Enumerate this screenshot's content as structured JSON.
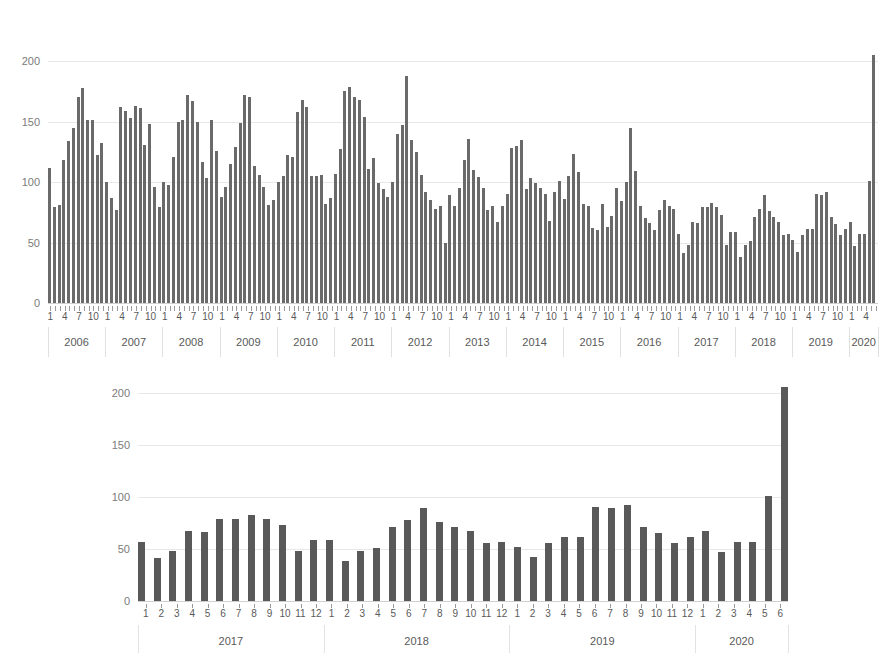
{
  "document": {
    "title_remnant": "",
    "background_color": "#ffffff",
    "bar_color": "#5f5f5f",
    "gridline_color": "#e8e8e8",
    "text_color": "#595959"
  },
  "chart_data": [
    {
      "id": "monthly-series-full",
      "type": "bar",
      "title": "",
      "subtitle": "",
      "xlabel": "",
      "ylabel": "",
      "ylim": [
        0,
        215
      ],
      "yticks": [
        0,
        50,
        100,
        150,
        200
      ],
      "ytick_labels": [
        "0",
        "50",
        "100",
        "150",
        "200"
      ],
      "grid": true,
      "legend": false,
      "x_month_tick_labels": [
        "1",
        "4",
        "7",
        "10"
      ],
      "year_groups": [
        "2006",
        "2007",
        "2008",
        "2009",
        "2010",
        "2011",
        "2012",
        "2013",
        "2014",
        "2015",
        "2016",
        "2017",
        "2018",
        "2019",
        "2020"
      ],
      "x_start": "2006-01",
      "x_end": "2020-06",
      "categories": [
        "2006-1",
        "2006-2",
        "2006-3",
        "2006-4",
        "2006-5",
        "2006-6",
        "2006-7",
        "2006-8",
        "2006-9",
        "2006-10",
        "2006-11",
        "2006-12",
        "2007-1",
        "2007-2",
        "2007-3",
        "2007-4",
        "2007-5",
        "2007-6",
        "2007-7",
        "2007-8",
        "2007-9",
        "2007-10",
        "2007-11",
        "2007-12",
        "2008-1",
        "2008-2",
        "2008-3",
        "2008-4",
        "2008-5",
        "2008-6",
        "2008-7",
        "2008-8",
        "2008-9",
        "2008-10",
        "2008-11",
        "2008-12",
        "2009-1",
        "2009-2",
        "2009-3",
        "2009-4",
        "2009-5",
        "2009-6",
        "2009-7",
        "2009-8",
        "2009-9",
        "2009-10",
        "2009-11",
        "2009-12",
        "2010-1",
        "2010-2",
        "2010-3",
        "2010-4",
        "2010-5",
        "2010-6",
        "2010-7",
        "2010-8",
        "2010-9",
        "2010-10",
        "2010-11",
        "2010-12",
        "2011-1",
        "2011-2",
        "2011-3",
        "2011-4",
        "2011-5",
        "2011-6",
        "2011-7",
        "2011-8",
        "2011-9",
        "2011-10",
        "2011-11",
        "2011-12",
        "2012-1",
        "2012-2",
        "2012-3",
        "2012-4",
        "2012-5",
        "2012-6",
        "2012-7",
        "2012-8",
        "2012-9",
        "2012-10",
        "2012-11",
        "2012-12",
        "2013-1",
        "2013-2",
        "2013-3",
        "2013-4",
        "2013-5",
        "2013-6",
        "2013-7",
        "2013-8",
        "2013-9",
        "2013-10",
        "2013-11",
        "2013-12",
        "2014-1",
        "2014-2",
        "2014-3",
        "2014-4",
        "2014-5",
        "2014-6",
        "2014-7",
        "2014-8",
        "2014-9",
        "2014-10",
        "2014-11",
        "2014-12",
        "2015-1",
        "2015-2",
        "2015-3",
        "2015-4",
        "2015-5",
        "2015-6",
        "2015-7",
        "2015-8",
        "2015-9",
        "2015-10",
        "2015-11",
        "2015-12",
        "2016-1",
        "2016-2",
        "2016-3",
        "2016-4",
        "2016-5",
        "2016-6",
        "2016-7",
        "2016-8",
        "2016-9",
        "2016-10",
        "2016-11",
        "2016-12",
        "2017-1",
        "2017-2",
        "2017-3",
        "2017-4",
        "2017-5",
        "2017-6",
        "2017-7",
        "2017-8",
        "2017-9",
        "2017-10",
        "2017-11",
        "2017-12",
        "2018-1",
        "2018-2",
        "2018-3",
        "2018-4",
        "2018-5",
        "2018-6",
        "2018-7",
        "2018-8",
        "2018-9",
        "2018-10",
        "2018-11",
        "2018-12",
        "2019-1",
        "2019-2",
        "2019-3",
        "2019-4",
        "2019-5",
        "2019-6",
        "2019-7",
        "2019-8",
        "2019-9",
        "2019-10",
        "2019-11",
        "2019-12",
        "2020-1",
        "2020-2",
        "2020-3",
        "2020-4",
        "2020-5",
        "2020-6"
      ],
      "values": [
        112,
        79,
        81,
        118,
        134,
        145,
        170,
        178,
        151,
        151,
        122,
        132,
        100,
        87,
        77,
        162,
        159,
        153,
        163,
        161,
        131,
        148,
        96,
        79,
        100,
        98,
        121,
        150,
        151,
        172,
        167,
        150,
        117,
        103,
        151,
        126,
        88,
        96,
        115,
        129,
        149,
        172,
        170,
        113,
        106,
        96,
        81,
        85,
        100,
        105,
        122,
        121,
        158,
        168,
        162,
        105,
        105,
        106,
        82,
        87,
        107,
        127,
        175,
        179,
        170,
        168,
        154,
        111,
        120,
        99,
        94,
        88,
        100,
        140,
        147,
        188,
        135,
        125,
        106,
        92,
        85,
        78,
        80,
        50,
        89,
        80,
        95,
        118,
        136,
        110,
        104,
        95,
        77,
        80,
        67,
        80,
        90,
        128,
        130,
        135,
        94,
        103,
        99,
        95,
        90,
        68,
        92,
        101,
        86,
        105,
        123,
        108,
        82,
        80,
        62,
        60,
        82,
        63,
        72,
        95,
        84,
        100,
        145,
        109,
        80,
        70,
        66,
        60,
        77,
        85,
        80,
        78,
        57,
        41,
        48,
        67,
        66,
        79,
        79,
        83,
        79,
        73,
        48,
        59,
        59,
        38,
        48,
        51,
        71,
        78,
        89,
        76,
        71,
        67,
        56,
        57,
        52,
        42,
        56,
        61,
        61,
        90,
        89,
        92,
        71,
        65,
        56,
        61,
        67,
        47,
        57,
        57,
        101,
        205
      ]
    },
    {
      "id": "monthly-series-recent",
      "type": "bar",
      "title": "",
      "subtitle": "",
      "xlabel": "",
      "ylabel": "",
      "ylim": [
        0,
        215
      ],
      "yticks": [
        0,
        50,
        100,
        150,
        200
      ],
      "ytick_labels": [
        "0",
        "50",
        "100",
        "150",
        "200"
      ],
      "grid": true,
      "legend": false,
      "year_groups": [
        "2017",
        "2018",
        "2019",
        "2020"
      ],
      "x_start": "2017-01",
      "x_end": "2020-06",
      "categories": [
        "2017-1",
        "2017-2",
        "2017-3",
        "2017-4",
        "2017-5",
        "2017-6",
        "2017-7",
        "2017-8",
        "2017-9",
        "2017-10",
        "2017-11",
        "2017-12",
        "2018-1",
        "2018-2",
        "2018-3",
        "2018-4",
        "2018-5",
        "2018-6",
        "2018-7",
        "2018-8",
        "2018-9",
        "2018-10",
        "2018-11",
        "2018-12",
        "2019-1",
        "2019-2",
        "2019-3",
        "2019-4",
        "2019-5",
        "2019-6",
        "2019-7",
        "2019-8",
        "2019-9",
        "2019-10",
        "2019-11",
        "2019-12",
        "2020-1",
        "2020-2",
        "2020-3",
        "2020-4",
        "2020-5",
        "2020-6"
      ],
      "month_labels": [
        "1",
        "2",
        "3",
        "4",
        "5",
        "6",
        "7",
        "8",
        "9",
        "10",
        "11",
        "12",
        "1",
        "2",
        "3",
        "4",
        "5",
        "6",
        "7",
        "8",
        "9",
        "10",
        "11",
        "12",
        "1",
        "2",
        "3",
        "4",
        "5",
        "6",
        "7",
        "8",
        "9",
        "10",
        "11",
        "12",
        "1",
        "2",
        "3",
        "4",
        "5",
        "6"
      ],
      "values": [
        57,
        41,
        48,
        67,
        66,
        79,
        79,
        83,
        79,
        73,
        48,
        59,
        59,
        38,
        48,
        51,
        71,
        78,
        89,
        76,
        71,
        67,
        56,
        57,
        52,
        42,
        56,
        61,
        61,
        90,
        89,
        92,
        71,
        65,
        56,
        61,
        67,
        47,
        57,
        57,
        101,
        205
      ]
    }
  ]
}
